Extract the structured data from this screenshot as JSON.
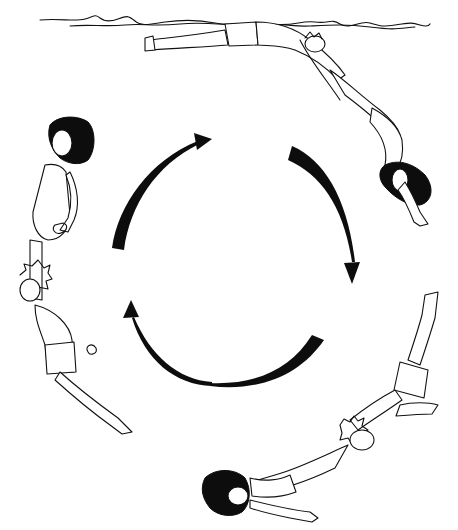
{
  "illustration": {
    "subject": "two swimmers performing a circular underwater roll, shown in four stages",
    "background_color": "#ffffff",
    "ink_color": "#111111",
    "cycle_direction": "clockwise",
    "arrows": [
      {
        "position": "top-left",
        "points": "toward top"
      },
      {
        "position": "top-right",
        "points": "down-right"
      },
      {
        "position": "bottom-right",
        "points": "toward bottom-left"
      },
      {
        "position": "bottom-left",
        "points": "up-left"
      }
    ],
    "stages": [
      {
        "position": "top",
        "description": "pair floating at water surface, boy arched backward under water line"
      },
      {
        "position": "right",
        "description": "girl diving head-down with dark hair"
      },
      {
        "position": "bottom-right",
        "description": "pair stretched diagonally, boy's legs raised upward"
      },
      {
        "position": "left",
        "description": "pair vertical, girl upright above boy"
      }
    ],
    "water_surface": "wavy line across top of image"
  }
}
